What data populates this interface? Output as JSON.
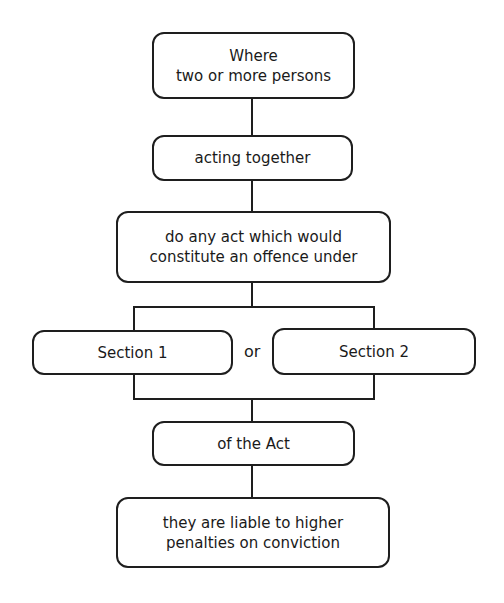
{
  "diagram": {
    "nodes": [
      {
        "id": "where",
        "text": "Where\ntwo or more persons",
        "lines": [
          "Where",
          "two or more persons"
        ]
      },
      {
        "id": "acting",
        "text": "acting together",
        "lines": [
          "acting together"
        ]
      },
      {
        "id": "act",
        "text": "do any act which would constitute an offence under",
        "lines": [
          "do any act which would",
          "constitute an offence under"
        ]
      },
      {
        "id": "s1",
        "text": "Section 1",
        "lines": [
          "Section 1"
        ]
      },
      {
        "id": "s2",
        "text": "Section 2",
        "lines": [
          "Section 2"
        ]
      },
      {
        "id": "ofact",
        "text": "of the Act",
        "lines": [
          "of the Act"
        ]
      },
      {
        "id": "liable",
        "text": "they are liable to higher penalties on conviction",
        "lines": [
          "they are liable to higher",
          "penalties on conviction"
        ]
      }
    ],
    "connector_label": "or",
    "edges": [
      [
        "where",
        "acting"
      ],
      [
        "acting",
        "act"
      ],
      [
        "act",
        "s1"
      ],
      [
        "act",
        "s2"
      ],
      [
        "s1",
        "ofact"
      ],
      [
        "s2",
        "ofact"
      ],
      [
        "ofact",
        "liable"
      ]
    ]
  }
}
